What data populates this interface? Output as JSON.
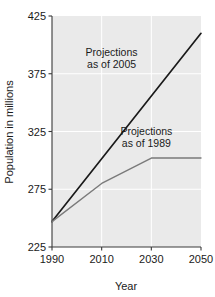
{
  "chart_data": {
    "type": "line",
    "title": "",
    "xlabel": "Year",
    "ylabel": "Population in millions",
    "xlim": [
      1990,
      2050
    ],
    "ylim": [
      225,
      425
    ],
    "xticks": [
      1990,
      2010,
      2030,
      2050
    ],
    "yticks": [
      225,
      275,
      325,
      375,
      425
    ],
    "xtick_labels": [
      "1990",
      "2010",
      "2030",
      "2050"
    ],
    "ytick_labels": [
      "225",
      "275",
      "325",
      "375",
      "425"
    ],
    "grid": true,
    "legend": "annotations-inline",
    "plot_background": "#eaeaea",
    "series": [
      {
        "name": "Projections as of 2005",
        "color": "#1a1a1a",
        "x": [
          1990,
          2050
        ],
        "values": [
          247,
          410
        ]
      },
      {
        "name": "Projections as of 1989",
        "color": "#7a7a7a",
        "x": [
          1990,
          2010,
          2030,
          2050
        ],
        "values": [
          247,
          280,
          302,
          302
        ]
      }
    ],
    "annotations": [
      {
        "id": "annot-2005",
        "line1": "Projections",
        "line2": "as of 2005",
        "x": 2014,
        "y": 390
      },
      {
        "id": "annot-1989",
        "line1": "Projections",
        "line2": "as of 1989",
        "x": 2028,
        "y": 322
      }
    ]
  },
  "axes": {
    "y_title": "Population in millions",
    "x_title": "Year"
  }
}
